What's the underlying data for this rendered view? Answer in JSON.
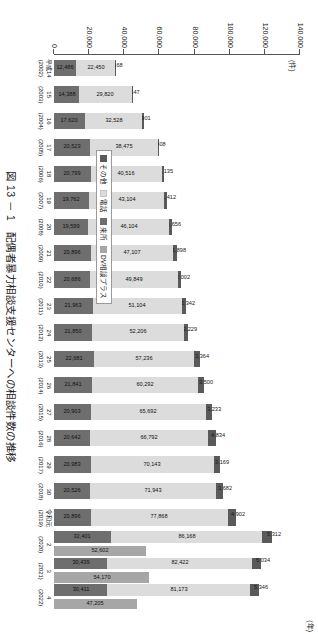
{
  "figure": {
    "number": "図 13 － 1",
    "title": "図 13 － 1　配偶者暴力相談支援センターへの相談件数の推移",
    "unit_y": "(件)",
    "unit_x": "(年)"
  },
  "legend": {
    "items": [
      {
        "label": "その他",
        "color": "#5a5a5a",
        "key": "other"
      },
      {
        "label": "電話",
        "color": "#dcdcdc",
        "key": "phone"
      },
      {
        "label": "来所",
        "color": "#6e6e6e",
        "key": "visit"
      },
      {
        "label": "DV相談プラス",
        "color": "#a6a6a6",
        "key": "dvplus"
      }
    ]
  },
  "axis": {
    "yticks": [
      "0",
      "20,000",
      "40,000",
      "60,000",
      "80,000",
      "100,000",
      "120,000",
      "140,000"
    ],
    "ymax": 140000
  },
  "chart_data": {
    "type": "bar",
    "title": "配偶者暴力相談支援センターへの相談件数の推移",
    "xlabel": "(年)",
    "ylabel": "(件)",
    "ylim": [
      0,
      140000
    ],
    "grid": false,
    "stacked": true,
    "legend_position": "inside-lower-left",
    "categories": [
      "平成14",
      "15",
      "16",
      "17",
      "18",
      "19",
      "20",
      "21",
      "22",
      "23",
      "24",
      "25",
      "26",
      "27",
      "28",
      "29",
      "30",
      "令和元",
      "2",
      "3",
      "4"
    ],
    "tick_labels": [
      "平成14\n(2002)",
      "15\n(2003)",
      "16\n(2004)",
      "17\n(2005)",
      "18\n(2006)",
      "19\n(2007)",
      "20\n(2008)",
      "21\n(2009)",
      "22\n(2010)",
      "23\n(2011)",
      "24\n(2012)",
      "25\n(2013)",
      "26\n(2014)",
      "27\n(2015)",
      "28\n(2016)",
      "29\n(2017)",
      "30\n(2018)",
      "令和元\n(2019)",
      "2\n(2020)",
      "3\n(2021)",
      "4\n(2022)"
    ],
    "years": [
      "(2002)",
      "(2003)",
      "(2004)",
      "(2005)",
      "(2006)",
      "(2007)",
      "(2008)",
      "(2009)",
      "(2010)",
      "(2011)",
      "(2012)",
      "(2013)",
      "(2014)",
      "(2015)",
      "(2016)",
      "(2017)",
      "(2018)",
      "(2019)",
      "(2020)",
      "(2021)",
      "(2022)"
    ],
    "series": [
      {
        "name": "来所",
        "key": "visit",
        "color": "#6e6e6e",
        "values": [
          12486,
          14388,
          17620,
          20523,
          20799,
          19762,
          19599,
          20896,
          20686,
          21963,
          21850,
          22681,
          21841,
          20903,
          20642,
          20983,
          20526,
          20896,
          32401,
          30439,
          30411
        ]
      },
      {
        "name": "電話",
        "key": "phone",
        "color": "#dcdcdc",
        "values": [
          22450,
          29820,
          32528,
          38475,
          40516,
          43104,
          46104,
          47107,
          49849,
          51104,
          52206,
          57236,
          60292,
          65692,
          66792,
          70143,
          71943,
          77868,
          86168,
          82422,
          81173
        ]
      },
      {
        "name": "その他",
        "key": "other",
        "color": "#5a5a5a",
        "values": [
          168,
          647,
          901,
          808,
          1135,
          1412,
          1656,
          1898,
          2002,
          2342,
          2229,
          3364,
          3500,
          3233,
          4834,
          3169,
          3682,
          4902,
          5312,
          5034,
          5346
        ]
      },
      {
        "name": "DV相談プラス",
        "key": "dvplus",
        "color": "#a6a6a6",
        "values": [
          0,
          0,
          0,
          0,
          0,
          0,
          0,
          0,
          0,
          0,
          0,
          0,
          0,
          0,
          0,
          0,
          0,
          0,
          52602,
          54170,
          47205
        ]
      }
    ],
    "data_labels": {
      "visit": [
        "12,486",
        "14,388",
        "17,620",
        "20,523",
        "20,799",
        "19,762",
        "19,599",
        "20,896",
        "20,686",
        "21,963",
        "21,850",
        "22,681",
        "21,841",
        "20,903",
        "20,642",
        "20,983",
        "20,526",
        "20,896",
        "32,401",
        "30,439",
        "30,411"
      ],
      "phone": [
        "22,450",
        "29,820",
        "32,528",
        "38,475",
        "40,516",
        "43,104",
        "46,104",
        "47,107",
        "49,849",
        "51,104",
        "52,206",
        "57,236",
        "60,292",
        "65,692",
        "66,792",
        "70,143",
        "71,943",
        "77,868",
        "86,168",
        "82,422",
        "81,173"
      ],
      "other": [
        "168",
        "647",
        "901",
        "808",
        "1,135",
        "1,412",
        "1,656",
        "1,898",
        "2,002",
        "2,342",
        "2,229",
        "3,364",
        "3,500",
        "3,233",
        "4,834",
        "3,169",
        "3,682",
        "4,902",
        "5,312",
        "5,034",
        "5,346"
      ],
      "dvplus": [
        "",
        "",
        "",
        "",
        "",
        "",
        "",
        "",
        "",
        "",
        "",
        "",
        "",
        "",
        "",
        "",
        "",
        "",
        "52,602",
        "54,170",
        "47,205"
      ]
    }
  }
}
